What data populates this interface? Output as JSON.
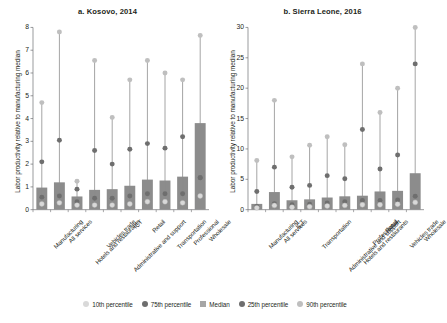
{
  "figure": {
    "ylabel": "Labor productivity relative to manufacturing median"
  },
  "colors": {
    "p10": "#d9d9d9",
    "p25": "#6e6e6e",
    "median": "#a6a6a6",
    "p75": "#6e6e6e",
    "p90": "#bfbfbf",
    "bar": "#8c8c8c",
    "stem": "#8c8c8c",
    "axis": "#6d6e71",
    "text": "#231f20"
  },
  "legend": {
    "items": [
      {
        "label": "10th percentile",
        "marker": "dot",
        "color": "#d9d9d9"
      },
      {
        "label": "75th percentile",
        "marker": "dot",
        "color": "#6e6e6e"
      },
      {
        "label": "Median",
        "marker": "square",
        "color": "#a6a6a6"
      },
      {
        "label": "25th percentile",
        "marker": "dot",
        "color": "#6e6e6e"
      },
      {
        "label": "90th percentile",
        "marker": "dot",
        "color": "#bfbfbf"
      }
    ]
  },
  "chart_data": [
    {
      "type": "bar",
      "panel": "a",
      "title": "a. Kosovo, 2014",
      "xlabel": "",
      "ylabel": "Labor productivity relative to manufacturing median",
      "ylim": [
        0,
        8
      ],
      "yticks": [
        0,
        1,
        2,
        3,
        4,
        5,
        6,
        7,
        8
      ],
      "grid": false,
      "categories": [
        "Manufacturing",
        "All services",
        "Hotels and restaurants",
        "Vehicles trade",
        "Administrative and support",
        "ICT",
        "Retail",
        "Transportation",
        "Professional",
        "Wholesale"
      ],
      "series": [
        {
          "name": "10th percentile",
          "values": [
            0.25,
            0.3,
            0.2,
            0.2,
            0.2,
            0.25,
            0.35,
            0.35,
            0.3,
            0.6
          ]
        },
        {
          "name": "25th percentile",
          "values": [
            0.55,
            0.6,
            0.35,
            0.5,
            0.5,
            0.6,
            0.7,
            0.7,
            0.7,
            1.4
          ]
        },
        {
          "name": "Median",
          "values": [
            0.97,
            1.2,
            0.58,
            0.87,
            0.9,
            1.05,
            1.32,
            1.28,
            1.45,
            3.8
          ]
        },
        {
          "name": "75th percentile",
          "values": [
            2.1,
            3.05,
            0.9,
            2.6,
            2.0,
            2.65,
            2.9,
            2.7,
            3.2,
            1.4
          ]
        },
        {
          "name": "90th percentile",
          "values": [
            4.7,
            7.8,
            1.25,
            6.55,
            4.05,
            5.7,
            6.55,
            6.0,
            5.7,
            7.65
          ]
        }
      ]
    },
    {
      "type": "bar",
      "panel": "b",
      "title": "b. Sierra Leone, 2016",
      "xlabel": "",
      "ylabel": "Labor productivity relative to manufacturing median",
      "ylim": [
        0,
        30
      ],
      "yticks": [
        0,
        5,
        10,
        15,
        20,
        25,
        30
      ],
      "grid": false,
      "categories": [
        "Manufacturing",
        "All services",
        "ICT",
        "Transportation",
        "Administrative and support",
        "Hotels and restaurants",
        "Professional",
        "Retail",
        "Vehicles trade",
        "Wholesale"
      ],
      "series": [
        {
          "name": "10th percentile",
          "values": [
            0.3,
            0.7,
            0.4,
            0.5,
            0.6,
            0.7,
            0.8,
            0.8,
            0.9,
            1.2
          ]
        },
        {
          "name": "25th percentile",
          "values": [
            0.55,
            1.0,
            0.8,
            0.9,
            1.1,
            1.3,
            1.5,
            1.5,
            1.6,
            2.2
          ]
        },
        {
          "name": "Median",
          "values": [
            0.95,
            2.9,
            1.55,
            1.7,
            2.0,
            2.2,
            2.3,
            3.0,
            3.1,
            6.0
          ]
        },
        {
          "name": "75th percentile",
          "values": [
            3.0,
            7.0,
            3.7,
            4.0,
            5.6,
            5.1,
            13.2,
            6.7,
            9.0,
            24.0
          ]
        },
        {
          "name": "90th percentile",
          "values": [
            8.1,
            18.0,
            8.7,
            10.6,
            12.0,
            10.7,
            24.0,
            16.0,
            20.0,
            30.0
          ]
        }
      ]
    }
  ]
}
